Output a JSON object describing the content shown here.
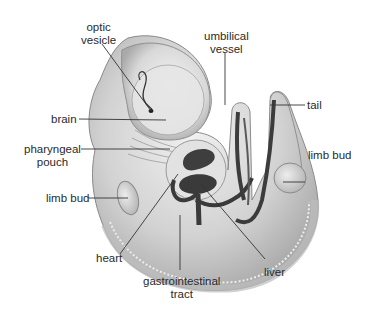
{
  "diagram": {
    "labels": {
      "optic_vesicle": [
        "optic",
        "vesicle"
      ],
      "brain": "brain",
      "pharyngeal_pouch": [
        "pharyngeal",
        "pouch"
      ],
      "limb_bud_left": "limb bud",
      "heart": "heart",
      "gastrointestinal_tract": [
        "gastrointestinal",
        "tract"
      ],
      "liver": "liver",
      "umbilical_vessel": [
        "umbilical",
        "vessel"
      ],
      "tail": "tail",
      "limb_bud_right": "limb bud"
    },
    "colors": {
      "background": "#ffffff",
      "body_fill": "#d4d4d4",
      "body_shade": "#9a9a9a",
      "organ_fill": "#3c3c3c",
      "leader_line": "#333333",
      "text": "#2a2a2a"
    }
  }
}
